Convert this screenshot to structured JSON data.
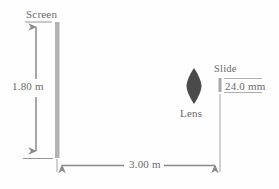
{
  "figure": {
    "type": "optics-ray-diagram",
    "background_color": "#fefefe",
    "stroke_color": "#8a8a8a",
    "text_color": "#6a6a6a",
    "screen_color": "#b0b0b0",
    "lens_color": "#4a4a4a",
    "labels": {
      "screen": "Screen",
      "screen_height": "1.80 m",
      "lens": "Lens",
      "slide": "Slide",
      "slide_height": "24.0 mm",
      "distance": "3.00 m"
    },
    "measurements": [
      {
        "name": "screen-height",
        "value": "1.80",
        "unit": "m",
        "orientation": "vertical"
      },
      {
        "name": "slide-height",
        "value": "24.0",
        "unit": "mm",
        "orientation": "vertical"
      },
      {
        "name": "lens-to-screen-distance",
        "value": "3.00",
        "unit": "m",
        "orientation": "horizontal"
      }
    ],
    "components": [
      {
        "name": "screen",
        "label": "Screen"
      },
      {
        "name": "lens",
        "label": "Lens"
      },
      {
        "name": "slide",
        "label": "Slide"
      }
    ]
  }
}
